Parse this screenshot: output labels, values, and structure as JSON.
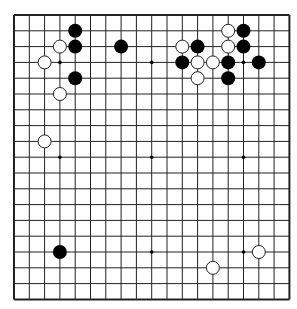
{
  "board": {
    "size": 19,
    "origin_x": 14,
    "origin_y": 15,
    "spacing_x": 15.3,
    "spacing_y": 15.8,
    "line_color": "#222222",
    "background": "#ffffff",
    "stone_radius": 7,
    "hoshi": [
      [
        3,
        3
      ],
      [
        9,
        3
      ],
      [
        15,
        3
      ],
      [
        3,
        9
      ],
      [
        9,
        9
      ],
      [
        15,
        9
      ],
      [
        3,
        15
      ],
      [
        9,
        15
      ],
      [
        15,
        15
      ]
    ]
  },
  "stones": [
    {
      "color": "black",
      "col": 4,
      "row": 1
    },
    {
      "color": "black",
      "col": 4,
      "row": 2
    },
    {
      "color": "white",
      "col": 3,
      "row": 2
    },
    {
      "color": "black",
      "col": 7,
      "row": 2
    },
    {
      "color": "white",
      "col": 2,
      "row": 3
    },
    {
      "color": "black",
      "col": 4,
      "row": 4
    },
    {
      "color": "white",
      "col": 3,
      "row": 5
    },
    {
      "color": "white",
      "col": 2,
      "row": 8
    },
    {
      "color": "white",
      "col": 14,
      "row": 1
    },
    {
      "color": "black",
      "col": 15,
      "row": 1
    },
    {
      "color": "white",
      "col": 11,
      "row": 2
    },
    {
      "color": "black",
      "col": 12,
      "row": 2
    },
    {
      "color": "white",
      "col": 14,
      "row": 2
    },
    {
      "color": "black",
      "col": 15,
      "row": 2
    },
    {
      "color": "black",
      "col": 11,
      "row": 3
    },
    {
      "color": "white",
      "col": 12,
      "row": 3
    },
    {
      "color": "white",
      "col": 13,
      "row": 3
    },
    {
      "color": "black",
      "col": 14,
      "row": 3
    },
    {
      "color": "black",
      "col": 16,
      "row": 3
    },
    {
      "color": "white",
      "col": 12,
      "row": 4
    },
    {
      "color": "black",
      "col": 14,
      "row": 4
    },
    {
      "color": "black",
      "col": 3,
      "row": 15
    },
    {
      "color": "white",
      "col": 16,
      "row": 15
    },
    {
      "color": "white",
      "col": 13,
      "row": 16
    }
  ]
}
